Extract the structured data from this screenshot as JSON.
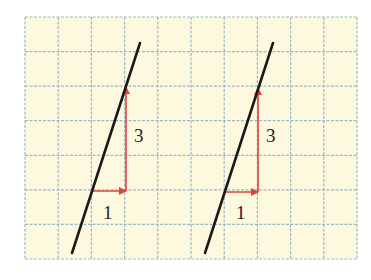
{
  "grid": {
    "x0": 25,
    "y0": 17,
    "x1": 357,
    "y1": 259,
    "cols": 10,
    "rows": 7,
    "background": "#fdf9df",
    "line_color": "#9fb9c4"
  },
  "colors": {
    "line": "#1a1a1a",
    "arrow": "#e0423b"
  },
  "diagrams": [
    {
      "line": {
        "x1": 140,
        "y1": 43,
        "x2": 72,
        "y2": 253
      },
      "run": {
        "x1": 93,
        "y1": 191,
        "x2": 126,
        "y2": 191,
        "label": "1",
        "lx": 103,
        "ly": 219
      },
      "rise": {
        "x1": 126,
        "y1": 191,
        "x2": 126,
        "y2": 87,
        "label": "3",
        "lx": 134,
        "ly": 142
      }
    },
    {
      "line": {
        "x1": 273,
        "y1": 43,
        "x2": 205,
        "y2": 253
      },
      "run": {
        "x1": 225,
        "y1": 192,
        "x2": 258,
        "y2": 192,
        "label": "1",
        "lx": 236,
        "ly": 219
      },
      "rise": {
        "x1": 258,
        "y1": 192,
        "x2": 258,
        "y2": 88,
        "label": "3",
        "lx": 266,
        "ly": 142
      }
    }
  ]
}
